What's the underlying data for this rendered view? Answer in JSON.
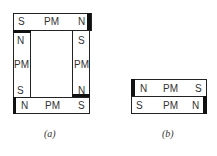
{
  "figure_a": {
    "caption": "(a)",
    "top_magnet": {
      "left": "S",
      "middle": "PM",
      "right": "N"
    },
    "left_magnet": {
      "top": "N",
      "middle": "PM",
      "bottom": "S"
    },
    "right_magnet": {
      "top": "S",
      "middle": "PM",
      "bottom": "N"
    },
    "bottom_magnet": {
      "left": "N",
      "middle": "PM",
      "right": "S"
    }
  },
  "figure_b": {
    "caption": "(b)",
    "top_magnet": {
      "left": "N",
      "middle": "PM",
      "right": "S"
    },
    "bottom_magnet": {
      "left": "S",
      "middle": "PM",
      "right": "N"
    }
  }
}
